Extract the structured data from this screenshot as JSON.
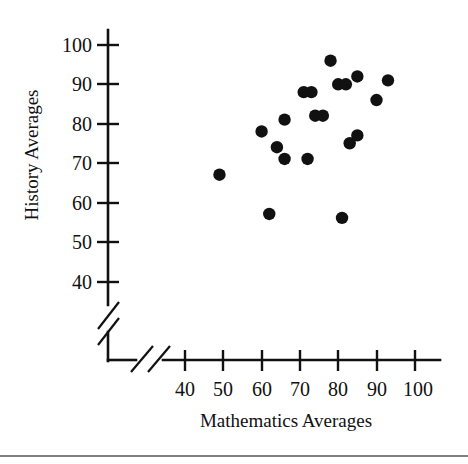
{
  "chart_data": {
    "type": "scatter",
    "title": "",
    "xlabel": "Mathematics Averages",
    "ylabel": "History Averages",
    "xticks": [
      40,
      50,
      60,
      70,
      80,
      90,
      100
    ],
    "yticks": [
      40,
      50,
      60,
      70,
      80,
      90,
      100
    ],
    "xlim": [
      35,
      104
    ],
    "ylim": [
      36,
      103
    ],
    "grid": false,
    "legend": null,
    "axis_break_x": true,
    "axis_break_y": true,
    "points": [
      {
        "x": 49,
        "y": 67
      },
      {
        "x": 62,
        "y": 57
      },
      {
        "x": 60,
        "y": 78
      },
      {
        "x": 64,
        "y": 74
      },
      {
        "x": 66,
        "y": 81
      },
      {
        "x": 66,
        "y": 71
      },
      {
        "x": 72,
        "y": 71
      },
      {
        "x": 74,
        "y": 82
      },
      {
        "x": 76,
        "y": 82
      },
      {
        "x": 78,
        "y": 96
      },
      {
        "x": 71,
        "y": 88
      },
      {
        "x": 73,
        "y": 88
      },
      {
        "x": 80,
        "y": 90
      },
      {
        "x": 82,
        "y": 90
      },
      {
        "x": 85,
        "y": 92
      },
      {
        "x": 93,
        "y": 91
      },
      {
        "x": 90,
        "y": 86
      },
      {
        "x": 83,
        "y": 75
      },
      {
        "x": 85,
        "y": 77
      },
      {
        "x": 81,
        "y": 56
      }
    ]
  },
  "labels": {
    "x_tick_0": "40",
    "x_tick_1": "50",
    "x_tick_2": "60",
    "x_tick_3": "70",
    "x_tick_4": "80",
    "x_tick_5": "90",
    "x_tick_6": "100",
    "y_tick_0": "100",
    "y_tick_1": "90",
    "y_tick_2": "80",
    "y_tick_3": "70",
    "y_tick_4": "60",
    "y_tick_5": "50",
    "y_tick_6": "40",
    "x_axis_title": "Mathematics Averages",
    "y_axis_title": "History Averages"
  },
  "colors": {
    "point": "#111111",
    "axis": "#111111",
    "background": "#ffffff",
    "rule": "#555555"
  }
}
